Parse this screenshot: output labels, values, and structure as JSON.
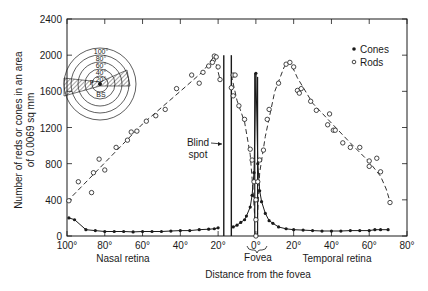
{
  "chart_data": {
    "type": "scatter",
    "title": "",
    "xlabel": "Distance from the fovea",
    "ylabel": "Number of reds or cones in an area of 0.0069 sq mm",
    "ylabel_lines": [
      "Number of reds or cones in an area",
      "of 0.0069 sq mm"
    ],
    "xlim": [
      -100,
      80
    ],
    "ylim": [
      0,
      2400
    ],
    "x_ticks": [
      -100,
      -80,
      -60,
      -40,
      -20,
      0,
      20,
      40,
      60,
      80
    ],
    "x_tick_labels": [
      "100°",
      "80°",
      "60°",
      "40°",
      "20°",
      "0°",
      "20°",
      "40°",
      "60°",
      "80°"
    ],
    "y_ticks": [
      0,
      400,
      800,
      1200,
      1600,
      2000,
      2400
    ],
    "y_tick_labels": [
      "0",
      "400",
      "800",
      "1200",
      "1600",
      "2000",
      "2400"
    ],
    "grid": false,
    "legend_position": "upper right",
    "region_labels": {
      "nasal": "Nasal retina",
      "temporal": "Temporal retina",
      "fovea": "Fovea",
      "blind_spot_line1": "Blind",
      "blind_spot_line2": "spot"
    },
    "blind_spot_range": [
      -17,
      -13
    ],
    "inset": {
      "ring_labels": [
        "100°",
        "80°",
        "60°",
        "40°",
        "20°"
      ],
      "center_labels": [
        "F",
        "BS"
      ]
    },
    "series": [
      {
        "name": "Cones",
        "marker": "filled-circle",
        "line": "solid",
        "points": [
          [
            -99,
            200
          ],
          [
            -96,
            180
          ],
          [
            -90,
            70
          ],
          [
            -85,
            60
          ],
          [
            -80,
            50
          ],
          [
            -75,
            50
          ],
          [
            -70,
            50
          ],
          [
            -65,
            45
          ],
          [
            -60,
            50
          ],
          [
            -55,
            50
          ],
          [
            -50,
            50
          ],
          [
            -45,
            55
          ],
          [
            -40,
            60
          ],
          [
            -35,
            60
          ],
          [
            -30,
            70
          ],
          [
            -25,
            75
          ],
          [
            -22,
            80
          ],
          [
            -20,
            90
          ],
          [
            -12,
            100
          ],
          [
            -10,
            120
          ],
          [
            -8,
            150
          ],
          [
            -6,
            180
          ],
          [
            -5,
            220
          ],
          [
            -3,
            320
          ],
          [
            -2,
            450
          ],
          [
            -1,
            700
          ],
          [
            0,
            1800
          ],
          [
            1,
            800
          ],
          [
            2,
            500
          ],
          [
            3,
            380
          ],
          [
            5,
            250
          ],
          [
            7,
            170
          ],
          [
            9,
            140
          ],
          [
            12,
            100
          ],
          [
            16,
            80
          ],
          [
            20,
            70
          ],
          [
            25,
            65
          ],
          [
            30,
            60
          ],
          [
            35,
            55
          ],
          [
            40,
            55
          ],
          [
            45,
            55
          ],
          [
            50,
            60
          ],
          [
            55,
            60
          ],
          [
            60,
            60
          ],
          [
            63,
            70
          ],
          [
            66,
            70
          ],
          [
            70,
            70
          ]
        ]
      },
      {
        "name": "Rods",
        "marker": "open-circle",
        "line": "dashed",
        "points_nasal": [
          [
            -99,
            390
          ],
          [
            -94,
            600
          ],
          [
            -87,
            480
          ],
          [
            -86,
            700
          ],
          [
            -83,
            850
          ],
          [
            -80,
            730
          ],
          [
            -74,
            980
          ],
          [
            -68,
            1060
          ],
          [
            -66,
            1150
          ],
          [
            -63,
            1160
          ],
          [
            -58,
            1270
          ],
          [
            -53,
            1330
          ],
          [
            -48,
            1400
          ],
          [
            -42,
            1630
          ],
          [
            -34,
            1780
          ],
          [
            -30,
            1690
          ],
          [
            -28,
            1810
          ],
          [
            -25,
            1880
          ],
          [
            -23,
            1920
          ],
          [
            -22,
            1990
          ],
          [
            -21,
            1980
          ],
          [
            -20,
            1870
          ],
          [
            -19,
            1730
          ]
        ],
        "points_central": [
          [
            -12,
            1780
          ],
          [
            -11,
            1780
          ],
          [
            -13,
            1640
          ],
          [
            -12,
            1550
          ],
          [
            -9,
            1440
          ],
          [
            -6,
            1290
          ],
          [
            -3,
            960
          ],
          [
            -2,
            840
          ],
          [
            -1,
            600
          ],
          [
            0,
            400
          ],
          [
            0,
            180
          ],
          [
            0,
            0
          ],
          [
            1,
            600
          ],
          [
            2,
            840
          ],
          [
            4,
            950
          ],
          [
            6,
            1290
          ],
          [
            7,
            1400
          ],
          [
            12,
            1690
          ],
          [
            16,
            1900
          ],
          [
            18,
            1920
          ],
          [
            20,
            1870
          ],
          [
            22,
            1610
          ],
          [
            23,
            1580
          ],
          [
            24,
            1630
          ],
          [
            29,
            1490
          ],
          [
            32,
            1390
          ],
          [
            38,
            1230
          ],
          [
            39,
            1350
          ],
          [
            41,
            1170
          ],
          [
            42,
            1170
          ],
          [
            46,
            1030
          ],
          [
            50,
            980
          ],
          [
            55,
            980
          ],
          [
            60,
            830
          ],
          [
            60,
            770
          ],
          [
            64,
            860
          ],
          [
            66,
            710
          ],
          [
            71,
            370
          ]
        ]
      }
    ],
    "legend": [
      {
        "label": "Cones",
        "marker": "filled-circle"
      },
      {
        "label": "Rods",
        "marker": "open-circle"
      }
    ]
  },
  "legend": {
    "cones": "Cones",
    "rods": "Rods"
  },
  "colors": {
    "ink": "#1a1a1a",
    "background": "#ffffff"
  }
}
